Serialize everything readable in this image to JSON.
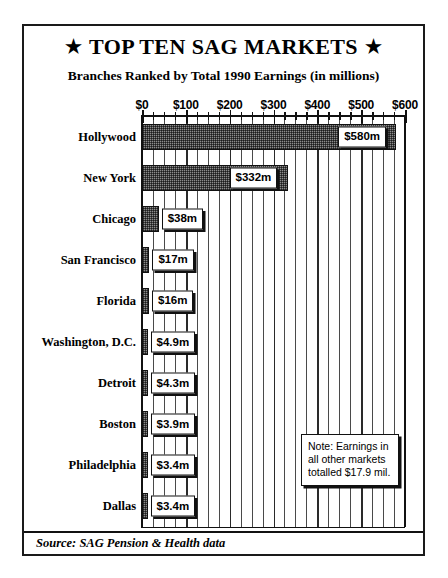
{
  "poster": {
    "title_text": "TOP TEN SAG MARKETS",
    "title_star_left": "★",
    "title_star_right": "★",
    "subtitle": "Branches Ranked by Total 1990 Earnings (in millions)",
    "source": "Source: SAG Pension & Health data",
    "note_lines": [
      "Note: Earnings in",
      "all other markets",
      "totalled $17.9 mil."
    ]
  },
  "chart_data": {
    "type": "bar",
    "orientation": "horizontal",
    "title": "TOP TEN SAG MARKETS",
    "subtitle": "Branches Ranked by Total 1990 Earnings (in millions)",
    "xlabel": "",
    "ylabel": "",
    "xlim": [
      0,
      600
    ],
    "grid": true,
    "grid_minor_step": 25,
    "grid_major_step": 100,
    "legend": "none",
    "categories": [
      "Hollywood",
      "New York",
      "Chicago",
      "San Francisco",
      "Florida",
      "Washington, D.C.",
      "Detroit",
      "Boston",
      "Philadelphia",
      "Dallas"
    ],
    "values": [
      580,
      332,
      38,
      17,
      16,
      4.9,
      4.3,
      3.9,
      3.4,
      3.4
    ],
    "value_labels": [
      "$580m",
      "$332m",
      "$38m",
      "$17m",
      "$16m",
      "$4.9m",
      "$4.3m",
      "$3.9m",
      "$3.4m",
      "$3.4m"
    ],
    "x_ticks": [
      0,
      100,
      200,
      300,
      400,
      500,
      600
    ],
    "x_tick_labels": [
      "$0",
      "$100",
      "$200",
      "$300",
      "$400",
      "$500",
      "$600"
    ],
    "annotation": "Note: Earnings in all other markets totalled $17.9 mil.",
    "colors": {
      "bar_fill": "#8c8c8c",
      "bar_edge": "#111111",
      "grid": "#2a2a2a",
      "background": "#ffffff",
      "text": "#000000"
    }
  }
}
